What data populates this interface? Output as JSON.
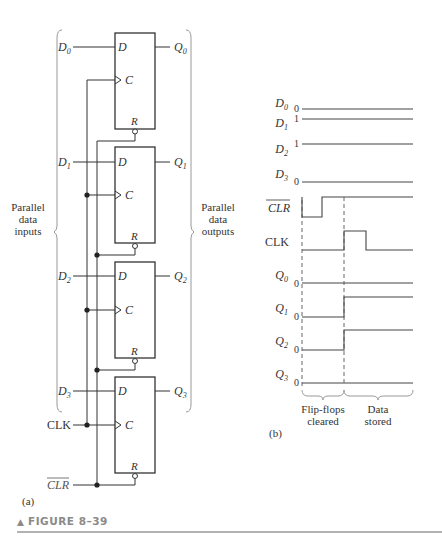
{
  "figure": {
    "caption": "FIGURE 8–39",
    "caption_marker": "▲",
    "accent_color": "#8a8a8a",
    "rule_color": "#666666"
  },
  "part_a": {
    "label": "(a)",
    "flip_flops": [
      {
        "d_input": "D",
        "d_sub": "0",
        "q_output": "Q",
        "q_sub": "0",
        "pin_d": "D",
        "pin_c": "C",
        "pin_r": "R"
      },
      {
        "d_input": "D",
        "d_sub": "1",
        "q_output": "Q",
        "q_sub": "1",
        "pin_d": "D",
        "pin_c": "C",
        "pin_r": "R"
      },
      {
        "d_input": "D",
        "d_sub": "2",
        "q_output": "Q",
        "q_sub": "2",
        "pin_d": "D",
        "pin_c": "C",
        "pin_r": "R"
      },
      {
        "d_input": "D",
        "d_sub": "3",
        "q_output": "Q",
        "q_sub": "3",
        "pin_d": "D",
        "pin_c": "C",
        "pin_r": "R"
      }
    ],
    "clk_label": "CLK",
    "clr_label": "CLR",
    "inputs_label": [
      "Parallel",
      "data",
      "inputs"
    ],
    "outputs_label": [
      "Parallel",
      "data",
      "outputs"
    ]
  },
  "part_b": {
    "label": "(b)",
    "signals": [
      {
        "name": "D",
        "sub": "0",
        "level_label": "0"
      },
      {
        "name": "D",
        "sub": "1",
        "level_label": "1"
      },
      {
        "name": "D",
        "sub": "2",
        "level_label": "1"
      },
      {
        "name": "D",
        "sub": "3",
        "level_label": "0"
      },
      {
        "name": "CLR",
        "sub": "",
        "level_label": ""
      },
      {
        "name": "CLK",
        "sub": "",
        "level_label": ""
      },
      {
        "name": "Q",
        "sub": "0",
        "level_label": "0"
      },
      {
        "name": "Q",
        "sub": "1",
        "level_label": "0"
      },
      {
        "name": "Q",
        "sub": "2",
        "level_label": "0"
      },
      {
        "name": "Q",
        "sub": "3",
        "level_label": "0"
      }
    ],
    "phase1": [
      "Flip-flops",
      "cleared"
    ],
    "phase2": [
      "Data",
      "stored"
    ]
  }
}
